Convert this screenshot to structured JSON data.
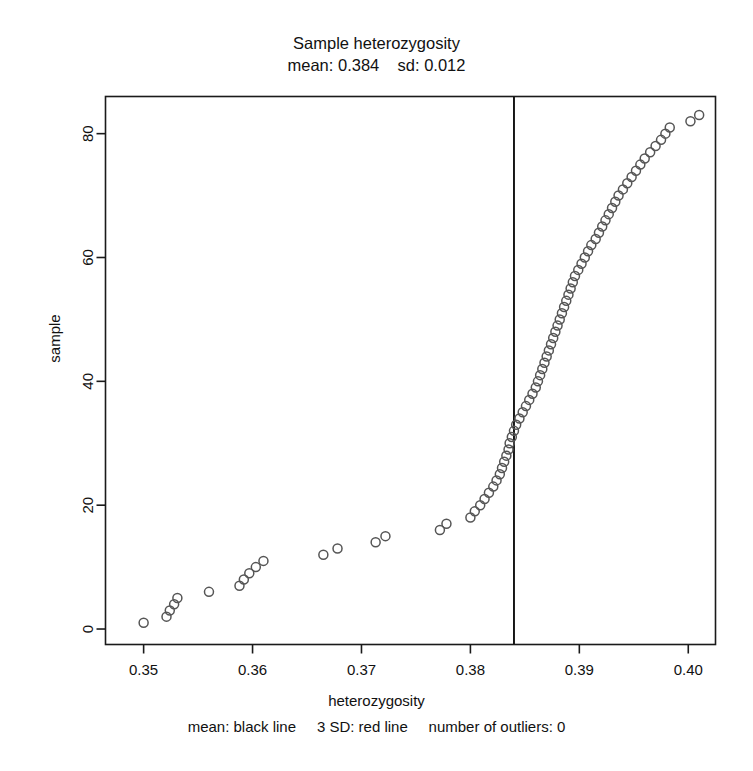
{
  "chart_data": {
    "type": "scatter",
    "title": "Sample heterozygosity",
    "subtitle": "mean: 0.384    sd: 0.012",
    "xlabel": "heterozygosity",
    "ylabel": "sample",
    "caption": "mean: black line     3 SD: red line     number of outliers: 0",
    "mean": 0.384,
    "sd": 0.012,
    "n_outliers": 0,
    "xlim": [
      0.3465,
      0.4025
    ],
    "ylim": [
      -2.5,
      86
    ],
    "xticks": [
      0.35,
      0.36,
      0.37,
      0.38,
      0.39,
      0.4
    ],
    "xticklabels": [
      "0.35",
      "0.36",
      "0.37",
      "0.38",
      "0.39",
      "0.40"
    ],
    "yticks": [
      0,
      20,
      40,
      60,
      80
    ],
    "yticklabels": [
      "0",
      "20",
      "40",
      "60",
      "80"
    ],
    "grid": false,
    "legend": false,
    "marker": "open-circle",
    "marker_color": "#555555",
    "marker_size": 9,
    "mean_line_color": "#000000",
    "mean_line_x": 0.384,
    "frame_color": "#1a1a1a",
    "background": "#ffffff",
    "x": [
      0.35,
      0.3521,
      0.3524,
      0.3528,
      0.3531,
      0.356,
      0.3588,
      0.3592,
      0.3597,
      0.3603,
      0.361,
      0.3665,
      0.3678,
      0.3713,
      0.3722,
      0.3772,
      0.3778,
      0.38,
      0.3804,
      0.3809,
      0.3813,
      0.3817,
      0.3821,
      0.3824,
      0.3827,
      0.3829,
      0.3831,
      0.3833,
      0.3835,
      0.3836,
      0.3838,
      0.384,
      0.3842,
      0.3845,
      0.3848,
      0.3851,
      0.3854,
      0.3857,
      0.386,
      0.3862,
      0.3864,
      0.3866,
      0.3868,
      0.387,
      0.3872,
      0.3874,
      0.3876,
      0.3878,
      0.388,
      0.3882,
      0.3884,
      0.3886,
      0.3888,
      0.389,
      0.3892,
      0.3894,
      0.3896,
      0.3899,
      0.3902,
      0.3905,
      0.3908,
      0.3911,
      0.3915,
      0.3918,
      0.3921,
      0.3924,
      0.3927,
      0.393,
      0.3933,
      0.3936,
      0.394,
      0.3944,
      0.3948,
      0.3952,
      0.3956,
      0.396,
      0.3965,
      0.397,
      0.3975,
      0.3979,
      0.3983,
      0.4002,
      0.401
    ],
    "y": [
      1,
      2,
      3,
      4,
      5,
      6,
      7,
      8,
      9,
      10,
      11,
      12,
      13,
      14,
      15,
      16,
      17,
      18,
      19,
      20,
      21,
      22,
      23,
      24,
      25,
      26,
      27,
      28,
      29,
      30,
      31,
      32,
      33,
      34,
      35,
      36,
      37,
      38,
      39,
      40,
      41,
      42,
      43,
      44,
      45,
      46,
      47,
      48,
      49,
      50,
      51,
      52,
      53,
      54,
      55,
      56,
      57,
      58,
      59,
      60,
      61,
      62,
      63,
      64,
      65,
      66,
      67,
      68,
      69,
      70,
      71,
      72,
      73,
      74,
      75,
      76,
      77,
      78,
      79,
      80,
      81,
      82,
      83
    ],
    "n_points": 83
  }
}
